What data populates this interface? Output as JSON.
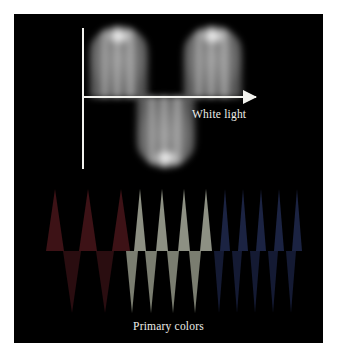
{
  "figure": {
    "page_background": "#ffffff",
    "plate_background": "#000000",
    "plate": {
      "x": 14,
      "y": 14,
      "width": 309,
      "height": 329
    }
  },
  "white_light": {
    "label": "White light",
    "label_color": "#efefea",
    "axis_color": "#f2f2ee",
    "axis": {
      "vertical": {
        "x": 68,
        "y": 14,
        "height": 141
      },
      "horizontal": {
        "x": 68,
        "y": 82,
        "length": 174
      },
      "arrow_tip_x": 243
    },
    "lobes": [
      {
        "name": "crest-1",
        "direction": "up",
        "x": 74,
        "y": 12,
        "width": 62,
        "height": 72,
        "peak_color": "#ffffff"
      },
      {
        "name": "trough-1",
        "direction": "down",
        "x": 121,
        "y": 82,
        "width": 62,
        "height": 72,
        "peak_color": "#ffffff"
      },
      {
        "name": "crest-2",
        "direction": "up",
        "x": 168,
        "y": 12,
        "width": 62,
        "height": 72,
        "peak_color": "#ffffff"
      }
    ]
  },
  "primary_colors": {
    "label": "Primary colors",
    "label_color": "#eeeee9",
    "groups": [
      {
        "name": "red",
        "color": "#3d1216",
        "color_dim": "#2a0d10",
        "x": 18,
        "width": 92,
        "spike_halfwidth": 9,
        "spike_height": 62,
        "wavelength": "long",
        "spikes_up": 3,
        "spikes_down": 2,
        "up_positions": [
          14,
          47,
          80
        ],
        "down_positions": [
          31,
          64
        ]
      },
      {
        "name": "green",
        "color": "#8d9083",
        "color_dim": "#7a7d70",
        "x": 112,
        "width": 88,
        "spike_halfwidth": 6,
        "spike_height": 62,
        "wavelength": "medium",
        "spikes_up": 4,
        "spikes_down": 4,
        "up_positions": [
          8,
          30,
          52,
          74
        ],
        "down_positions": [
          0,
          19,
          41,
          63
        ]
      },
      {
        "name": "blue",
        "color": "#1b2342",
        "color_dim": "#141a33",
        "x": 200,
        "width": 96,
        "spike_halfwidth": 5,
        "spike_height": 62,
        "wavelength": "short",
        "spikes_up": 5,
        "spikes_down": 5,
        "up_positions": [
          6,
          24,
          42,
          60,
          78
        ],
        "down_positions": [
          0,
          18,
          36,
          54,
          72
        ]
      }
    ]
  }
}
